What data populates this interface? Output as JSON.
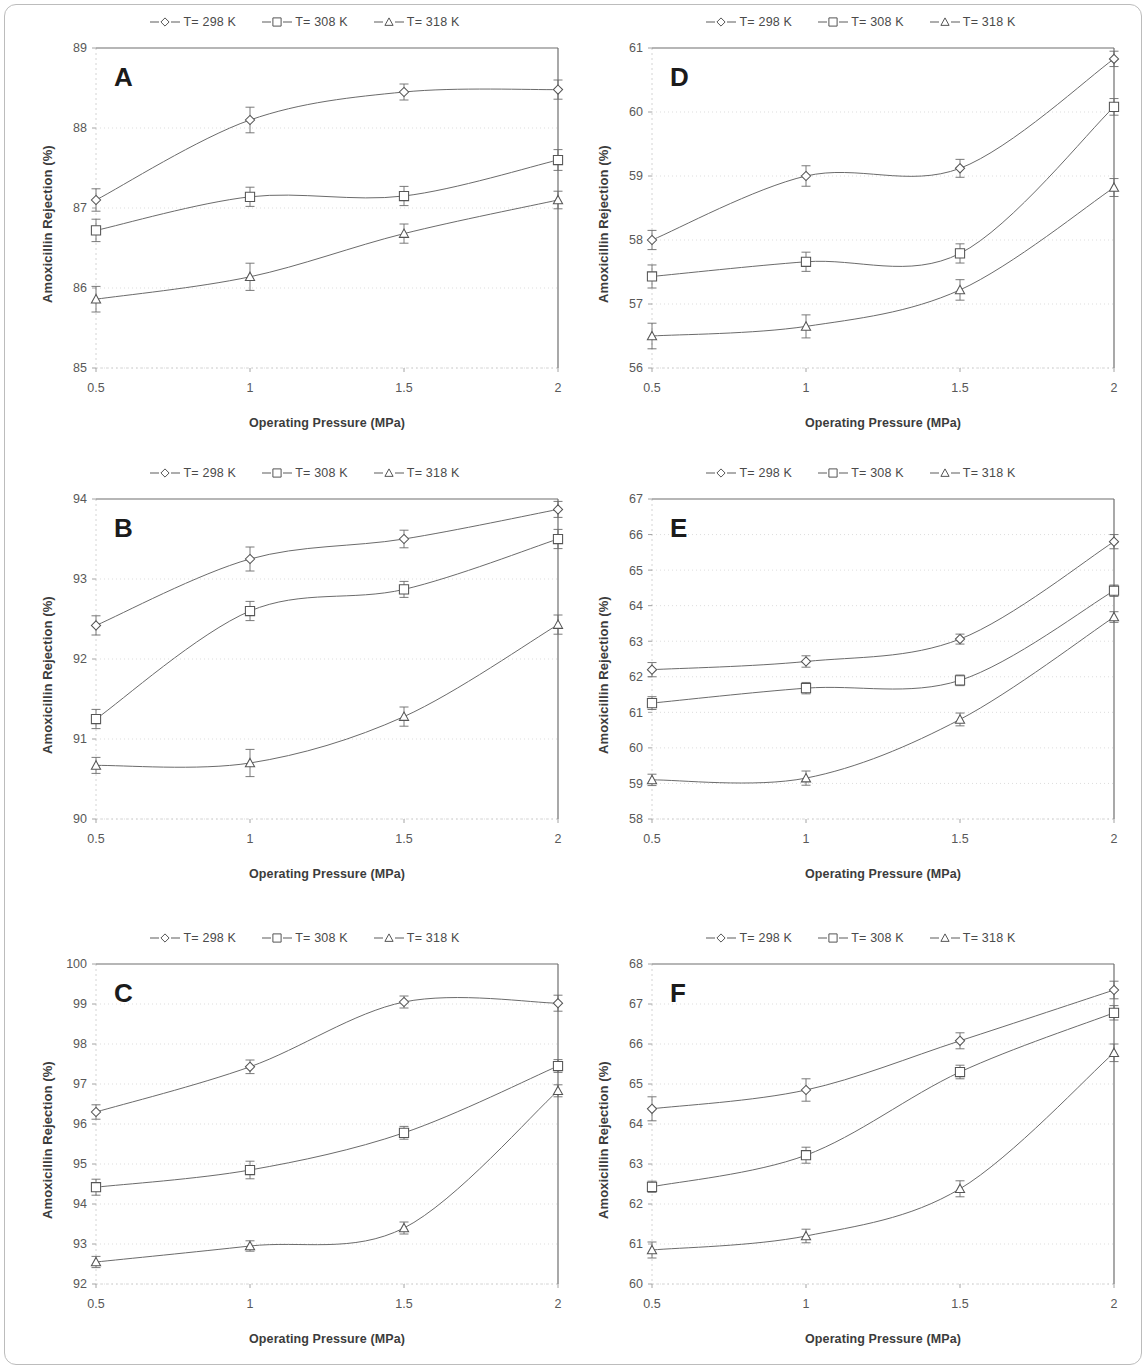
{
  "figure": {
    "axis_x_title": "Operating Pressure (MPa)",
    "axis_y_title": "Amoxicillin Rejection (%)",
    "legend": [
      {
        "label": "T= 298 K",
        "marker": "diamond-open-icon"
      },
      {
        "label": "T= 308 K",
        "marker": "square-open-icon"
      },
      {
        "label": "T= 318 K",
        "marker": "triangle-open-icon"
      }
    ],
    "line_color": "#6b6b6b",
    "marker_fill": "#ffffff",
    "marker_stroke": "#555555",
    "frame_color": "#6f6f6f",
    "grid_color": "#cfcfcf"
  },
  "chart_data": [
    {
      "id": "A",
      "type": "line",
      "title": "A",
      "xlabel": "Operating Pressure (MPa)",
      "ylabel": "Amoxicillin Rejection (%)",
      "x": [
        0.5,
        1,
        1.5,
        2
      ],
      "xticklabels": [
        "0.5",
        "1",
        "1.5",
        "2"
      ],
      "xlim": [
        0.5,
        2
      ],
      "ylim": [
        85,
        89
      ],
      "yticks": [
        85,
        86,
        87,
        88,
        89
      ],
      "yticklabels": [
        "85",
        "86",
        "87",
        "88",
        "89"
      ],
      "grid": true,
      "legend_position": "top-center",
      "series": [
        {
          "name": "T= 298 K",
          "marker": "diamond",
          "values": [
            87.1,
            88.1,
            88.45,
            88.48
          ],
          "errors": [
            0.14,
            0.16,
            0.1,
            0.12
          ]
        },
        {
          "name": "T= 308 K",
          "marker": "square",
          "values": [
            86.72,
            87.14,
            87.15,
            87.6
          ],
          "errors": [
            0.14,
            0.12,
            0.12,
            0.13
          ]
        },
        {
          "name": "T= 318 K",
          "marker": "triangle",
          "values": [
            85.86,
            86.14,
            86.68,
            87.1
          ],
          "errors": [
            0.16,
            0.17,
            0.12,
            0.11
          ]
        }
      ]
    },
    {
      "id": "D",
      "type": "line",
      "title": "D",
      "xlabel": "Operating Pressure (MPa)",
      "ylabel": "Amoxicillin Rejection (%)",
      "x": [
        0.5,
        1,
        1.5,
        2
      ],
      "xticklabels": [
        "0.5",
        "1",
        "1.5",
        "2"
      ],
      "xlim": [
        0.5,
        2
      ],
      "ylim": [
        56,
        61
      ],
      "yticks": [
        56,
        57,
        58,
        59,
        60,
        61
      ],
      "yticklabels": [
        "56",
        "57",
        "58",
        "59",
        "60",
        "61"
      ],
      "grid": true,
      "legend_position": "top-center",
      "series": [
        {
          "name": "T= 298 K",
          "marker": "diamond",
          "values": [
            58.0,
            59.0,
            59.12,
            60.83
          ],
          "errors": [
            0.15,
            0.16,
            0.14,
            0.12
          ]
        },
        {
          "name": "T= 308 K",
          "marker": "square",
          "values": [
            57.43,
            57.66,
            57.79,
            60.08
          ],
          "errors": [
            0.18,
            0.15,
            0.15,
            0.13
          ]
        },
        {
          "name": "T= 318 K",
          "marker": "triangle",
          "values": [
            56.5,
            56.65,
            57.22,
            58.82
          ],
          "errors": [
            0.2,
            0.18,
            0.16,
            0.14
          ]
        }
      ]
    },
    {
      "id": "B",
      "type": "line",
      "title": "B",
      "xlabel": "Operating Pressure (MPa)",
      "ylabel": "Amoxicillin Rejection (%)",
      "x": [
        0.5,
        1,
        1.5,
        2
      ],
      "xticklabels": [
        "0.5",
        "1",
        "1.5",
        "2"
      ],
      "xlim": [
        0.5,
        2
      ],
      "ylim": [
        90,
        94
      ],
      "yticks": [
        90,
        91,
        92,
        93,
        94
      ],
      "yticklabels": [
        "90",
        "91",
        "92",
        "93",
        "94"
      ],
      "grid": true,
      "legend_position": "top-center",
      "series": [
        {
          "name": "T= 298 K",
          "marker": "diamond",
          "values": [
            92.42,
            93.25,
            93.5,
            93.87
          ],
          "errors": [
            0.12,
            0.15,
            0.11,
            0.1
          ]
        },
        {
          "name": "T= 308 K",
          "marker": "square",
          "values": [
            91.25,
            92.6,
            92.87,
            93.5
          ],
          "errors": [
            0.12,
            0.12,
            0.1,
            0.12
          ]
        },
        {
          "name": "T= 318 K",
          "marker": "triangle",
          "values": [
            90.67,
            90.7,
            91.28,
            92.43
          ],
          "errors": [
            0.1,
            0.17,
            0.12,
            0.12
          ]
        }
      ]
    },
    {
      "id": "E",
      "type": "line",
      "title": "E",
      "xlabel": "Operating Pressure (MPa)",
      "ylabel": "Amoxicillin Rejection (%)",
      "x": [
        0.5,
        1,
        1.5,
        2
      ],
      "xticklabels": [
        "0.5",
        "1",
        "1.5",
        "2"
      ],
      "xlim": [
        0.5,
        2
      ],
      "ylim": [
        58,
        67
      ],
      "yticks": [
        58,
        59,
        60,
        61,
        62,
        63,
        64,
        65,
        66,
        67
      ],
      "yticklabels": [
        "58",
        "59",
        "60",
        "61",
        "62",
        "63",
        "64",
        "65",
        "66",
        "67"
      ],
      "grid": true,
      "legend_position": "top-center",
      "series": [
        {
          "name": "T= 298 K",
          "marker": "diamond",
          "values": [
            62.2,
            62.43,
            63.06,
            65.8
          ],
          "errors": [
            0.2,
            0.16,
            0.14,
            0.2
          ]
        },
        {
          "name": "T= 308 K",
          "marker": "square",
          "values": [
            61.26,
            61.68,
            61.9,
            64.42
          ],
          "errors": [
            0.18,
            0.16,
            0.15,
            0.16
          ]
        },
        {
          "name": "T= 318 K",
          "marker": "triangle",
          "values": [
            59.1,
            59.15,
            60.8,
            63.68
          ],
          "errors": [
            0.16,
            0.2,
            0.18,
            0.15
          ]
        }
      ]
    },
    {
      "id": "C",
      "type": "line",
      "title": "C",
      "xlabel": "Operating Pressure (MPa)",
      "ylabel": "Amoxicillin Rejection (%)",
      "x": [
        0.5,
        1,
        1.5,
        2
      ],
      "xticklabels": [
        "0.5",
        "1",
        "1.5",
        "2"
      ],
      "xlim": [
        0.5,
        2
      ],
      "ylim": [
        92,
        100
      ],
      "yticks": [
        92,
        93,
        94,
        95,
        96,
        97,
        98,
        99,
        100
      ],
      "yticklabels": [
        "92",
        "93",
        "94",
        "95",
        "96",
        "97",
        "98",
        "99",
        "100"
      ],
      "grid": true,
      "legend_position": "top-center",
      "series": [
        {
          "name": "T= 298 K",
          "marker": "diamond",
          "values": [
            96.3,
            97.43,
            99.05,
            99.02
          ],
          "errors": [
            0.18,
            0.17,
            0.15,
            0.2
          ]
        },
        {
          "name": "T= 308 K",
          "marker": "square",
          "values": [
            94.42,
            94.85,
            95.78,
            97.45
          ],
          "errors": [
            0.2,
            0.22,
            0.16,
            0.16
          ]
        },
        {
          "name": "T= 318 K",
          "marker": "triangle",
          "values": [
            92.55,
            92.95,
            93.4,
            96.83
          ],
          "errors": [
            0.14,
            0.13,
            0.15,
            0.15
          ]
        }
      ]
    },
    {
      "id": "F",
      "type": "line",
      "title": "F",
      "xlabel": "Operating Pressure (MPa)",
      "ylabel": "Amoxicillin Rejection (%)",
      "x": [
        0.5,
        1,
        1.5,
        2
      ],
      "xticklabels": [
        "0.5",
        "1",
        "1.5",
        "2"
      ],
      "xlim": [
        0.5,
        2
      ],
      "ylim": [
        60,
        68
      ],
      "yticks": [
        60,
        61,
        62,
        63,
        64,
        65,
        66,
        67,
        68
      ],
      "yticklabels": [
        "60",
        "61",
        "62",
        "63",
        "64",
        "65",
        "66",
        "67",
        "68"
      ],
      "grid": true,
      "legend_position": "top-center",
      "series": [
        {
          "name": "T= 298 K",
          "marker": "diamond",
          "values": [
            64.38,
            64.85,
            66.08,
            67.35
          ],
          "errors": [
            0.3,
            0.28,
            0.2,
            0.22
          ]
        },
        {
          "name": "T= 308 K",
          "marker": "square",
          "values": [
            62.43,
            63.22,
            65.3,
            66.78
          ],
          "errors": [
            0.14,
            0.2,
            0.17,
            0.18
          ]
        },
        {
          "name": "T= 318 K",
          "marker": "triangle",
          "values": [
            60.85,
            61.2,
            62.38,
            65.78
          ],
          "errors": [
            0.2,
            0.17,
            0.2,
            0.22
          ]
        }
      ]
    }
  ]
}
